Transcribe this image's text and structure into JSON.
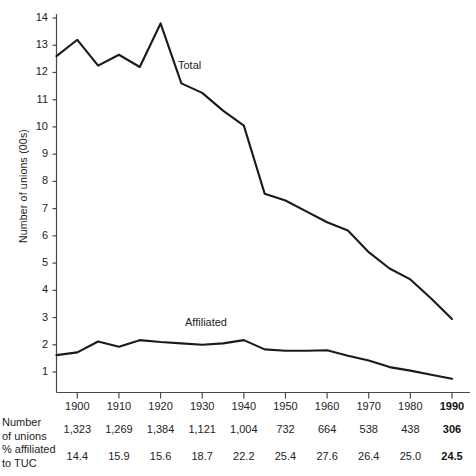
{
  "chart_data": {
    "type": "line",
    "title": "",
    "xlabel": "",
    "ylabel": "Number of unions  (00s)",
    "xlim": [
      1895,
      1990
    ],
    "ylim": [
      0,
      14.4
    ],
    "grid": false,
    "legend_position": "inline-annotation",
    "x": [
      1895,
      1900,
      1905,
      1910,
      1915,
      1920,
      1925,
      1930,
      1935,
      1940,
      1945,
      1950,
      1955,
      1960,
      1965,
      1970,
      1975,
      1980,
      1985,
      1990
    ],
    "xticks": [
      1900,
      1910,
      1920,
      1930,
      1940,
      1950,
      1960,
      1970,
      1980,
      1990
    ],
    "xtick_labels": [
      "1900",
      "1910",
      "1920",
      "1930",
      "1940",
      "1950",
      "1960",
      "1970",
      "1980",
      "1990"
    ],
    "yticks": [
      1,
      2,
      3,
      4,
      5,
      6,
      7,
      8,
      9,
      10,
      11,
      12,
      13,
      14
    ],
    "ytick_labels": [
      "1",
      "2",
      "3",
      "4",
      "5",
      "6",
      "7",
      "8",
      "9",
      "10",
      "11",
      "12",
      "13",
      "14"
    ],
    "series": [
      {
        "name": "Total",
        "label": "Total",
        "values": [
          12.6,
          13.2,
          12.25,
          12.65,
          12.2,
          13.8,
          11.6,
          11.25,
          10.6,
          10.05,
          7.55,
          7.3,
          6.9,
          6.5,
          6.2,
          5.4,
          4.8,
          4.4,
          3.7,
          2.95
        ]
      },
      {
        "name": "Affiliated",
        "label": "Affiliated",
        "values": [
          1.62,
          1.72,
          2.12,
          1.93,
          2.17,
          2.1,
          2.05,
          2.0,
          2.05,
          2.17,
          1.83,
          1.78,
          1.78,
          1.8,
          1.6,
          1.42,
          1.18,
          1.05,
          0.9,
          0.75
        ]
      }
    ]
  },
  "table": {
    "row_headers": [
      "Number\nof unions",
      "% affiliated\nto TUC"
    ],
    "row_header_lines": [
      [
        "Number",
        "of  unions"
      ],
      [
        "% affiliated",
        "to TUC"
      ]
    ],
    "columns": [
      "1900",
      "1910",
      "1920",
      "1930",
      "1940",
      "1950",
      "1960",
      "1970",
      "1980",
      "1990"
    ],
    "rows": [
      {
        "label": "Number of unions",
        "values": [
          "1,323",
          "1,269",
          "1,384",
          "1,121",
          "1,004",
          "732",
          "664",
          "538",
          "438",
          "306"
        ]
      },
      {
        "label": "% affiliated to TUC",
        "values": [
          "14.4",
          "15.9",
          "15.6",
          "18.7",
          "22.2",
          "25.4",
          "27.6",
          "26.4",
          "25.0",
          "24.5"
        ]
      }
    ],
    "emphasized_column_index": 9
  },
  "style": {
    "line_color": "#1a1a1a",
    "axis_color": "#4a4a4a",
    "text_color": "#232323",
    "background": "#ffffff"
  }
}
